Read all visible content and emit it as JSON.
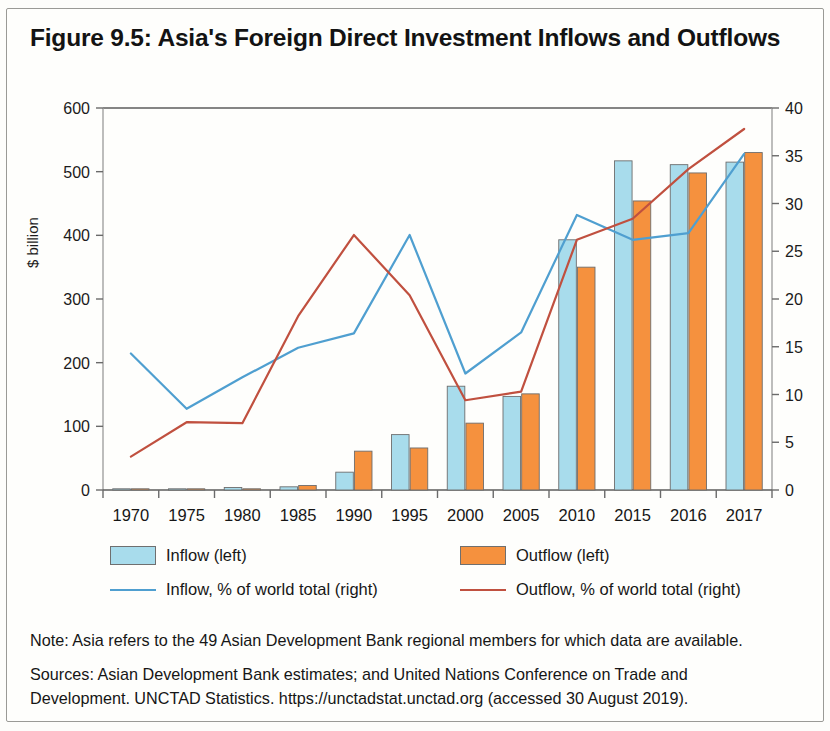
{
  "figure": {
    "title": "Figure 9.5: Asia's Foreign Direct Investment Inflows and Outflows"
  },
  "legend": {
    "items": [
      {
        "label": "Inflow (left)",
        "marker": "box",
        "color": "#a8dcec"
      },
      {
        "label": "Outflow (left)",
        "marker": "box",
        "color": "#f5913e"
      },
      {
        "label": "Inflow, % of world total (right)",
        "marker": "line",
        "color": "#4f9fd0"
      },
      {
        "label": "Outflow, % of world total (right)",
        "marker": "line",
        "color": "#c0503f"
      }
    ]
  },
  "notes": {
    "note": "Note: Asia refers to the 49 Asian Development Bank regional members for which data are available.",
    "sources_line1": "Sources: Asian Development Bank estimates; and United Nations Conference on Trade and",
    "sources_line2": "Development. UNCTAD Statistics. https://unctadstat.unctad.org (accessed 30 August 2019)."
  },
  "chart_data": {
    "type": "bar",
    "title": "Figure 9.5: Asia's Foreign Direct Investment Inflows and Outflows",
    "xlabel": "",
    "ylabel": "$ billion",
    "y2label": "% of world total",
    "categories": [
      "1970",
      "1975",
      "1980",
      "1985",
      "1990",
      "1995",
      "2000",
      "2005",
      "2010",
      "2015",
      "2016",
      "2017"
    ],
    "ylim": [
      0,
      600
    ],
    "yticks": [
      0,
      100,
      200,
      300,
      400,
      500,
      600
    ],
    "y2lim": [
      0,
      40
    ],
    "y2ticks": [
      0,
      5,
      10,
      15,
      20,
      25,
      30,
      35,
      40
    ],
    "grid": false,
    "legend_position": "below",
    "series": [
      {
        "name": "Inflow (left)",
        "type": "bar",
        "axis": "left",
        "color": "#a8dcec",
        "values": [
          1,
          1,
          4,
          5,
          28,
          87,
          163,
          147,
          393,
          517,
          511,
          515
        ]
      },
      {
        "name": "Outflow (left)",
        "type": "bar",
        "axis": "left",
        "color": "#f5913e",
        "values": [
          0,
          1,
          1,
          7,
          61,
          66,
          105,
          151,
          350,
          454,
          498,
          530
        ]
      },
      {
        "name": "Inflow, % of world total (right)",
        "type": "line",
        "axis": "right",
        "color": "#4f9fd0",
        "values": [
          14.3,
          8.5,
          11.8,
          14.9,
          16.4,
          26.7,
          12.2,
          16.5,
          28.8,
          26.2,
          26.9,
          35.2
        ]
      },
      {
        "name": "Outflow, % of world total (right)",
        "type": "line",
        "axis": "right",
        "color": "#c0503f",
        "values": [
          3.5,
          7.1,
          7.0,
          18.2,
          26.7,
          20.4,
          9.4,
          10.3,
          26.2,
          28.4,
          33.6,
          37.8
        ]
      }
    ]
  }
}
